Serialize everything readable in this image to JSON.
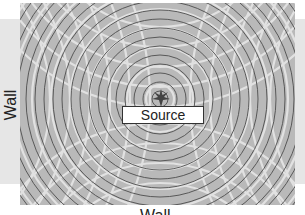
{
  "diagram": {
    "labels": {
      "left_wall": "Wall",
      "bottom_wall": "Wall",
      "source": "Source"
    },
    "icons": {
      "source": "starburst-icon"
    },
    "colors": {
      "background": "#ffffff",
      "wall_band": "#e6e6e6",
      "panel": "#b9b9b9",
      "rings": "#555555",
      "interference": "#f0f0f0"
    }
  }
}
